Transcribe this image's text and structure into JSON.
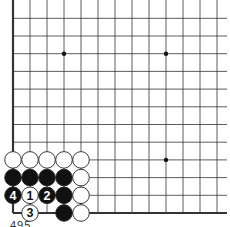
{
  "diagram": {
    "type": "go-board-corner",
    "board_color": "#ffffff",
    "line_color": "#333333",
    "edge_color": "#333333",
    "grid": {
      "origin_x": 13,
      "origin_y_bottom": 213,
      "col_spacing": 17,
      "row_spacing": 17.7,
      "cols": 13,
      "rows": 12,
      "open_right": true,
      "open_top": true
    },
    "star_points": [
      {
        "col": 3,
        "row": 9
      },
      {
        "col": 9,
        "row": 9
      },
      {
        "col": 9,
        "row": 3
      }
    ],
    "stones": [
      {
        "col": 0,
        "row": 3,
        "color": "white",
        "label": ""
      },
      {
        "col": 1,
        "row": 3,
        "color": "white",
        "label": ""
      },
      {
        "col": 2,
        "row": 3,
        "color": "white",
        "label": ""
      },
      {
        "col": 3,
        "row": 3,
        "color": "white",
        "label": ""
      },
      {
        "col": 4,
        "row": 3,
        "color": "white",
        "label": ""
      },
      {
        "col": 0,
        "row": 2,
        "color": "black",
        "label": ""
      },
      {
        "col": 1,
        "row": 2,
        "color": "black",
        "label": ""
      },
      {
        "col": 2,
        "row": 2,
        "color": "black",
        "label": ""
      },
      {
        "col": 3,
        "row": 2,
        "color": "black",
        "label": ""
      },
      {
        "col": 4,
        "row": 2,
        "color": "white",
        "label": ""
      },
      {
        "col": 0,
        "row": 1,
        "color": "black",
        "label": "4"
      },
      {
        "col": 1,
        "row": 1,
        "color": "white",
        "label": "1"
      },
      {
        "col": 2,
        "row": 1,
        "color": "black",
        "label": "2"
      },
      {
        "col": 3,
        "row": 1,
        "color": "black",
        "label": ""
      },
      {
        "col": 4,
        "row": 1,
        "color": "white",
        "label": ""
      },
      {
        "col": 1,
        "row": 0,
        "color": "white",
        "label": "3"
      },
      {
        "col": 3,
        "row": 0,
        "color": "black",
        "label": ""
      },
      {
        "col": 4,
        "row": 0,
        "color": "white",
        "label": ""
      }
    ],
    "caption": "495"
  }
}
